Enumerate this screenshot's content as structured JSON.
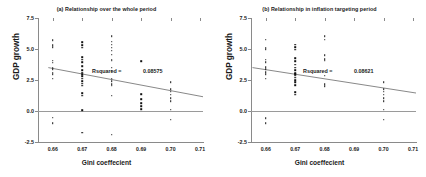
{
  "figure": {
    "ylabel": "GDP growth",
    "xlabel": "Gini coeffecient"
  },
  "chart_data": [
    {
      "type": "scatter",
      "title": "(a) Relationship over the whole period",
      "xlabel": "Gini coeffecient",
      "ylabel": "GDP growth",
      "xlim": [
        0.655,
        0.711
      ],
      "ylim": [
        -2.5,
        7.5
      ],
      "xticks": [
        "0.66",
        "0.67",
        "0.68",
        "0.69",
        "0.70",
        "0.71"
      ],
      "xtick_values": [
        0.66,
        0.67,
        0.68,
        0.69,
        0.7,
        0.71
      ],
      "yticks": [
        "7.5",
        "5.0",
        "2.5",
        "0.0",
        "-2.5"
      ],
      "ytick_values": [
        7.5,
        5.0,
        2.5,
        0.0,
        -2.5
      ],
      "grid": false,
      "legend": false,
      "annotation_label": "Rsquared =",
      "annotation_value": "0.08575",
      "rsquared": 0.08575,
      "trendline": {
        "x0": 0.6585,
        "y0": 3.5,
        "x1": 0.711,
        "y1": 1.15
      },
      "zero_reference_line": 0.0,
      "points": [
        {
          "x": 0.66,
          "y": 5.7
        },
        {
          "x": 0.66,
          "y": 5.3
        },
        {
          "x": 0.66,
          "y": 5.15
        },
        {
          "x": 0.66,
          "y": 4.05
        },
        {
          "x": 0.66,
          "y": 3.9
        },
        {
          "x": 0.66,
          "y": 3.5
        },
        {
          "x": 0.66,
          "y": 3.35
        },
        {
          "x": 0.66,
          "y": 3.1
        },
        {
          "x": 0.66,
          "y": 2.95
        },
        {
          "x": 0.66,
          "y": 2.6
        },
        {
          "x": 0.66,
          "y": -0.55
        },
        {
          "x": 0.66,
          "y": -1.0
        },
        {
          "x": 0.67,
          "y": 5.55
        },
        {
          "x": 0.67,
          "y": 5.3
        },
        {
          "x": 0.67,
          "y": 5.1
        },
        {
          "x": 0.67,
          "y": 4.35
        },
        {
          "x": 0.67,
          "y": 4.15
        },
        {
          "x": 0.67,
          "y": 3.95
        },
        {
          "x": 0.67,
          "y": 3.6
        },
        {
          "x": 0.67,
          "y": 3.3
        },
        {
          "x": 0.67,
          "y": 3.1
        },
        {
          "x": 0.67,
          "y": 2.95
        },
        {
          "x": 0.67,
          "y": 2.8
        },
        {
          "x": 0.67,
          "y": 2.6
        },
        {
          "x": 0.67,
          "y": 2.4
        },
        {
          "x": 0.67,
          "y": 2.2
        },
        {
          "x": 0.67,
          "y": 2.05
        },
        {
          "x": 0.67,
          "y": 1.45
        },
        {
          "x": 0.67,
          "y": 1.25
        },
        {
          "x": 0.67,
          "y": 0.05
        },
        {
          "x": 0.67,
          "y": -1.75
        },
        {
          "x": 0.68,
          "y": 6.05
        },
        {
          "x": 0.68,
          "y": 5.6
        },
        {
          "x": 0.68,
          "y": 5.35
        },
        {
          "x": 0.68,
          "y": 5.1
        },
        {
          "x": 0.68,
          "y": 4.85
        },
        {
          "x": 0.68,
          "y": 4.55
        },
        {
          "x": 0.68,
          "y": 4.15
        },
        {
          "x": 0.68,
          "y": 4.05
        },
        {
          "x": 0.68,
          "y": 3.5
        },
        {
          "x": 0.68,
          "y": 3.25
        },
        {
          "x": 0.68,
          "y": 2.6
        },
        {
          "x": 0.68,
          "y": 2.4
        },
        {
          "x": 0.68,
          "y": 2.15
        },
        {
          "x": 0.68,
          "y": 2.05
        },
        {
          "x": 0.68,
          "y": 1.25
        },
        {
          "x": 0.68,
          "y": -1.9
        },
        {
          "x": 0.69,
          "y": 4.0
        },
        {
          "x": 0.69,
          "y": 1.35
        },
        {
          "x": 0.69,
          "y": 0.95
        },
        {
          "x": 0.69,
          "y": 0.65
        },
        {
          "x": 0.69,
          "y": 0.4
        },
        {
          "x": 0.69,
          "y": 0.15
        },
        {
          "x": 0.7,
          "y": 2.3
        },
        {
          "x": 0.7,
          "y": 1.75
        },
        {
          "x": 0.7,
          "y": 1.55
        },
        {
          "x": 0.7,
          "y": 1.3
        },
        {
          "x": 0.7,
          "y": 1.05
        },
        {
          "x": 0.7,
          "y": 0.8
        },
        {
          "x": 0.7,
          "y": 0.1
        },
        {
          "x": 0.7,
          "y": -0.7
        }
      ]
    },
    {
      "type": "scatter",
      "title": "(b) Relationship in inflation targeting period",
      "xlabel": "Gini coeffecient",
      "ylabel": "GDP growth",
      "xlim": [
        0.655,
        0.711
      ],
      "ylim": [
        -2.5,
        7.5
      ],
      "xticks": [
        "0.66",
        "0.67",
        "0.68",
        "0.69",
        "0.70",
        "0.71"
      ],
      "xtick_values": [
        0.66,
        0.67,
        0.68,
        0.69,
        0.7,
        0.71
      ],
      "yticks": [
        "7.5",
        "5.0",
        "2.5",
        "0.0",
        "-2.5"
      ],
      "ytick_values": [
        7.5,
        5.0,
        2.5,
        0.0,
        -2.5
      ],
      "grid": false,
      "legend": false,
      "annotation_label": "Rsquared =",
      "annotation_value": "0.08621",
      "rsquared": 0.08621,
      "trendline": {
        "x0": 0.6555,
        "y0": 3.5,
        "x1": 0.711,
        "y1": 1.45
      },
      "zero_reference_line": 0.0,
      "points": [
        {
          "x": 0.66,
          "y": 5.75
        },
        {
          "x": 0.66,
          "y": 5.1
        },
        {
          "x": 0.66,
          "y": 5.0
        },
        {
          "x": 0.66,
          "y": 4.15
        },
        {
          "x": 0.66,
          "y": 3.95
        },
        {
          "x": 0.66,
          "y": 3.55
        },
        {
          "x": 0.66,
          "y": 3.35
        },
        {
          "x": 0.66,
          "y": 3.15
        },
        {
          "x": 0.66,
          "y": 2.95
        },
        {
          "x": 0.66,
          "y": 2.6
        },
        {
          "x": 0.66,
          "y": -0.6
        },
        {
          "x": 0.66,
          "y": -1.0
        },
        {
          "x": 0.67,
          "y": 5.35
        },
        {
          "x": 0.67,
          "y": 5.15
        },
        {
          "x": 0.67,
          "y": 4.95
        },
        {
          "x": 0.67,
          "y": 4.25
        },
        {
          "x": 0.67,
          "y": 4.0
        },
        {
          "x": 0.67,
          "y": 3.75
        },
        {
          "x": 0.67,
          "y": 3.5
        },
        {
          "x": 0.67,
          "y": 3.3
        },
        {
          "x": 0.67,
          "y": 3.05
        },
        {
          "x": 0.67,
          "y": 2.95
        },
        {
          "x": 0.67,
          "y": 2.85
        },
        {
          "x": 0.67,
          "y": 2.7
        },
        {
          "x": 0.67,
          "y": 2.5
        },
        {
          "x": 0.67,
          "y": 2.3
        },
        {
          "x": 0.67,
          "y": 2.1
        },
        {
          "x": 0.67,
          "y": 1.5
        },
        {
          "x": 0.67,
          "y": 1.3
        },
        {
          "x": 0.68,
          "y": 6.05
        },
        {
          "x": 0.68,
          "y": 5.75
        },
        {
          "x": 0.68,
          "y": 4.5
        },
        {
          "x": 0.68,
          "y": 4.2
        },
        {
          "x": 0.68,
          "y": 4.05
        },
        {
          "x": 0.68,
          "y": 2.85
        },
        {
          "x": 0.68,
          "y": 2.15
        },
        {
          "x": 0.68,
          "y": 2.0
        },
        {
          "x": 0.7,
          "y": 2.3
        },
        {
          "x": 0.7,
          "y": 1.75
        },
        {
          "x": 0.7,
          "y": 1.55
        },
        {
          "x": 0.7,
          "y": 1.3
        },
        {
          "x": 0.7,
          "y": 1.05
        },
        {
          "x": 0.7,
          "y": 0.8
        },
        {
          "x": 0.7,
          "y": 0.1
        },
        {
          "x": 0.7,
          "y": -0.7
        }
      ]
    }
  ]
}
